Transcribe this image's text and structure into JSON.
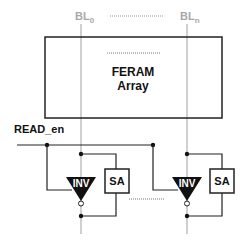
{
  "bitlines": {
    "first": {
      "base": "BL",
      "sub": "0"
    },
    "last": {
      "base": "BL",
      "sub": "n"
    }
  },
  "array": {
    "line1": "FERAM",
    "line2": "Array"
  },
  "signals": {
    "read_enable": "READ_en"
  },
  "columns": [
    {
      "inverter_label": "INV",
      "sense_amp_label": "SA"
    },
    {
      "inverter_label": "INV",
      "sense_amp_label": "SA"
    }
  ],
  "colors": {
    "bitline": "#b0b0b0",
    "wire": "#222222",
    "inverter_fill": "#111111"
  }
}
